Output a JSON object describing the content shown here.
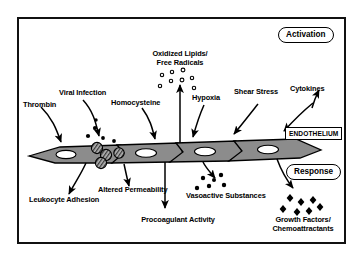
{
  "figure": {
    "border_color": "#111111",
    "background": "#ffffff",
    "cell_fill": "#8c8c8c",
    "nucleus_fill": "#ffffff"
  },
  "badges": {
    "activation": "Activation",
    "response": "Response",
    "endothelium": "ENDOTHELIUM"
  },
  "stimuli": [
    {
      "label": "Thrombin"
    },
    {
      "label": "Viral Infection"
    },
    {
      "label": "Homocysteine"
    },
    {
      "label": "Oxidized Lipids/"
    },
    {
      "label": "Free Radicals"
    },
    {
      "label": "Hypoxia"
    },
    {
      "label": "Shear Stress"
    },
    {
      "label": "Cytokines"
    }
  ],
  "responses": [
    {
      "label": "Leukocyte Adhesion"
    },
    {
      "label": "Altered Permeability"
    },
    {
      "label": "Procoagulant Activity"
    },
    {
      "label": "Vasoactive Substances"
    },
    {
      "label": "Growth Factors/"
    },
    {
      "label": "Chemoattractants"
    }
  ],
  "particles": {
    "free_radicals_count": 8,
    "thrombin_dots_count": 5,
    "vasoactive_dots_count": 6,
    "growth_factor_diamonds_count": 7,
    "leukocytes_count": 4
  }
}
